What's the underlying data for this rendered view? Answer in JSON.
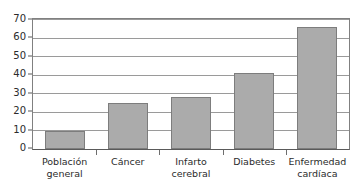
{
  "chart_data": {
    "type": "bar",
    "title": "",
    "subtitle": "",
    "xlabel": "",
    "ylabel": "",
    "categories": [
      "Población general",
      "Cáncer",
      "Infarto cerebral",
      "Diabetes",
      "Enfermedad cardíaca"
    ],
    "category_lines": [
      [
        "Población",
        "general"
      ],
      [
        "Cáncer"
      ],
      [
        "Infarto",
        "cerebral"
      ],
      [
        "Diabetes"
      ],
      [
        "Enfermedad",
        "cardíaca"
      ]
    ],
    "values": [
      10,
      25,
      28,
      41,
      66
    ],
    "ylim": [
      0,
      70
    ],
    "yticks": [
      0,
      10,
      20,
      30,
      40,
      50,
      60,
      70
    ],
    "ytick_labels": [
      "0",
      "10",
      "20",
      "30",
      "40",
      "50",
      "60",
      "70"
    ],
    "grid": true,
    "grid_axis": "y",
    "legend": false,
    "legend_position": "none",
    "bar_color": "#ababab",
    "bar_edge_color": "#7d7d7d",
    "grid_color": "#9a9a9a",
    "axis_color": "#5a5a5a",
    "background_color": "#ffffff",
    "text_color": "#2b2b2b"
  }
}
